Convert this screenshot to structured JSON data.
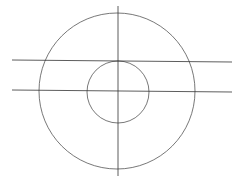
{
  "diagram": {
    "stroke_color": "#555555",
    "outer_circle": {
      "cx": 117,
      "cy": 91,
      "r": 78
    },
    "inner_circle": {
      "cx": 118,
      "cy": 92,
      "r": 31
    },
    "vertical_line": {
      "x1": 118,
      "y1": 6,
      "x2": 118,
      "y2": 176
    },
    "horizontal_lines": [
      {
        "x1": 12,
        "y1": 60,
        "x2": 232,
        "y2": 62
      },
      {
        "x1": 12,
        "y1": 90,
        "x2": 232,
        "y2": 92
      }
    ],
    "caption": ""
  }
}
